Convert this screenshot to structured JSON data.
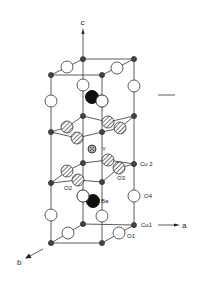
{
  "diagram": {
    "axes": {
      "c": {
        "label": "c"
      },
      "a": {
        "label": "a"
      },
      "b": {
        "label": "b"
      }
    },
    "labels": {
      "y": "Y",
      "cu2": "Cu 2",
      "o2": "O2",
      "o3": "O3",
      "ba": "Ba",
      "o4": "O4",
      "cu1": "Cu1",
      "o1": "O1"
    },
    "colors": {
      "line": "#333333",
      "cu_fill": "#444444",
      "ba_fill": "#111111",
      "o_fill": "#ffffff"
    }
  }
}
